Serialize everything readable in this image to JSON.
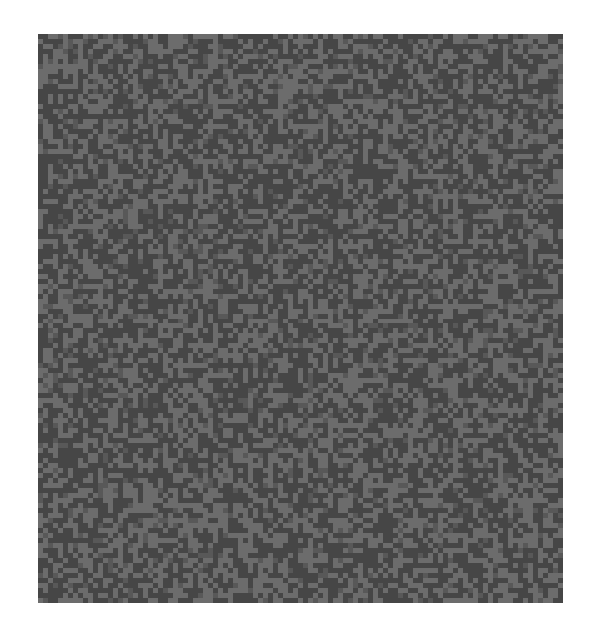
{
  "image": {
    "description": "Grey random binary noise texture square on white background",
    "background_color": "#ffffff",
    "texture": {
      "x": 38,
      "y": 34,
      "width": 525,
      "height": 569,
      "cols": 105,
      "rows": 114,
      "light_color": "#6c6c6c",
      "dark_color": "#464646",
      "mid_color": "#585858",
      "light_ratio": 0.5,
      "seed": 1337
    }
  }
}
